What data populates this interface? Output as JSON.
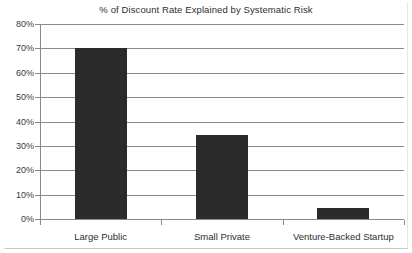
{
  "chart_data": {
    "type": "bar",
    "title": "% of Discount Rate Explained by Systematic Risk",
    "xlabel": "",
    "ylabel": "",
    "categories": [
      "Large Public",
      "Small Private",
      "Venture-Backed Startup"
    ],
    "values": [
      70,
      34.5,
      4.5
    ],
    "ylim": [
      0,
      80
    ],
    "ytick_values": [
      0,
      10,
      20,
      30,
      40,
      50,
      60,
      70,
      80
    ],
    "ytick_labels": [
      "0%",
      "10%",
      "20%",
      "30%",
      "40%",
      "50%",
      "60%",
      "70%",
      "80%"
    ],
    "grid": true,
    "legend": false,
    "series": [
      {
        "name": "% of Discount Rate Explained by Systematic Risk",
        "values": [
          70,
          34.5,
          4.5
        ]
      }
    ],
    "colors": {
      "bar_fill": "#2b2b2b",
      "gridline": "#8a8a8a",
      "axis": "#8a8a8a",
      "text": "#2e2e2e",
      "background": "#ffffff"
    }
  }
}
